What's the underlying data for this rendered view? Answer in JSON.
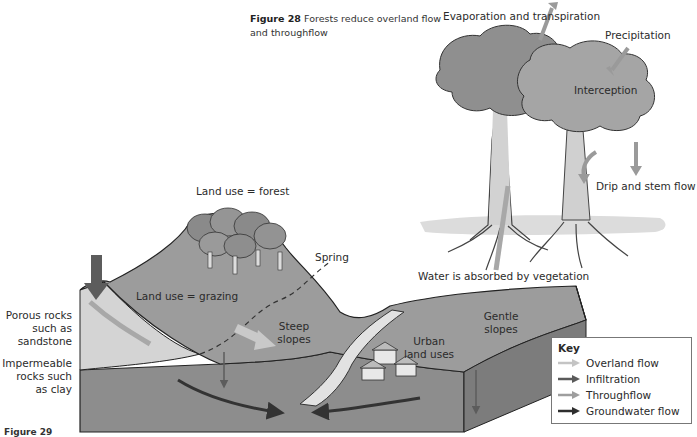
{
  "figure": {
    "number_label": "Figure 28",
    "title_line1": "Forests reduce overland flow",
    "title_line2": "and throughflow",
    "bottom_caption_fragment": "Figure 29"
  },
  "tree_diagram": {
    "labels": {
      "evaporation": "Evaporation and transpiration",
      "precipitation": "Precipitation",
      "interception": "Interception",
      "drip": "Drip and stem flow",
      "absorbed": "Water is absorbed by vegetation"
    }
  },
  "landscape_diagram": {
    "labels": {
      "forest": "Land use = forest",
      "spring": "Spring",
      "grazing": "Land use = grazing",
      "porous": [
        "Porous rocks",
        "such as",
        "sandstone"
      ],
      "impermeable": [
        "Impermeable",
        "rocks such",
        "as clay"
      ],
      "steep": [
        "Steep",
        "slopes"
      ],
      "urban": [
        "Urban",
        "land uses"
      ],
      "gentle": [
        "Gentle",
        "slopes"
      ]
    }
  },
  "key": {
    "title": "Key",
    "items": [
      {
        "label": "Overland flow",
        "color": "#c4c4c4"
      },
      {
        "label": "Infiltration",
        "color": "#5a5a5a"
      },
      {
        "label": "Throughflow",
        "color": "#9e9e9e"
      },
      {
        "label": "Groundwater flow",
        "color": "#2e2e2e"
      }
    ]
  },
  "colors": {
    "land_surface": "#9b9b9b",
    "upper_rock": "#cfcfcf",
    "lower_rock": "#8a8a8a",
    "tree_canopy": "#8f8f8f",
    "infiltration_arrow": "#5c5c5c",
    "overland_arrow": "#c8c8c8",
    "throughflow_arrow": "#a6a6a6",
    "groundwater_arrow": "#333333"
  }
}
